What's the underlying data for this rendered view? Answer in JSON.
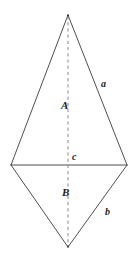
{
  "figure": {
    "background_color": "#ffffff",
    "stroke_color": "#3b3b3b",
    "dashed_stroke_color": "#7a7a7a",
    "label_color": "#1c1c1c",
    "canvas": {
      "width": 136,
      "height": 260
    },
    "vertices": {
      "top": {
        "x": 68,
        "y": 15
      },
      "left": {
        "x": 11,
        "y": 165
      },
      "right": {
        "x": 127,
        "y": 165
      },
      "bottom": {
        "x": 68,
        "y": 247
      }
    },
    "edges": [
      {
        "name": "top-left-edge",
        "from": "top",
        "to": "left"
      },
      {
        "name": "top-right-edge",
        "from": "top",
        "to": "right"
      },
      {
        "name": "bottom-left-edge",
        "from": "left",
        "to": "bottom"
      },
      {
        "name": "bottom-right-edge",
        "from": "right",
        "to": "bottom"
      }
    ],
    "diagonals": [
      {
        "name": "horizontal-diagonal",
        "style": "solid",
        "from": "left",
        "to": "right"
      },
      {
        "name": "vertical-diagonal",
        "style": "dashed",
        "from": "top",
        "to": "bottom"
      }
    ],
    "labels": {
      "upper_height": "A",
      "upper_side": "a",
      "base": "c",
      "lower_height": "B",
      "lower_side": "b"
    },
    "label_positions": {
      "upper_height": {
        "x": 61,
        "y": 100
      },
      "upper_side": {
        "x": 101,
        "y": 79
      },
      "base": {
        "x": 72,
        "y": 152
      },
      "lower_height": {
        "x": 62,
        "y": 187
      },
      "lower_side": {
        "x": 105,
        "y": 207
      }
    }
  }
}
